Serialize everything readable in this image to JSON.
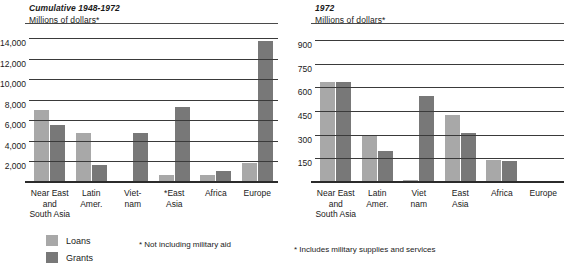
{
  "legend": {
    "loans_label": "Loans",
    "grants_label": "Grants",
    "loans_color": "#a8a8a8",
    "grants_color": "#787878"
  },
  "left": {
    "title": "Cumulative 1948-1972",
    "subtitle": "Millions of dollars*",
    "footnote": "* Not including military aid"
  },
  "right": {
    "title": "1972",
    "subtitle": "Millions of dollars*",
    "footnote": "* Includes military supplies and services"
  },
  "chart_data": [
    {
      "type": "bar",
      "title": "Cumulative 1948-1972",
      "subtitle": "Millions of dollars*",
      "xlabel": "",
      "ylabel": "Millions of dollars",
      "ylim": [
        0,
        15000
      ],
      "yticks": [
        "2,000",
        "4,000",
        "6,000",
        "8,000",
        "10,000",
        "12,000",
        "14,000"
      ],
      "ytick_values": [
        2000,
        4000,
        6000,
        8000,
        10000,
        12000,
        14000
      ],
      "grid": true,
      "legend_position": "below-left",
      "categories": [
        "Near East and South Asia",
        "Latin Amer.",
        "Viet-nam",
        "*East Asia",
        "Africa",
        "Europe"
      ],
      "category_lines": [
        [
          "Near East",
          "and",
          "South Asia"
        ],
        [
          "Latin",
          "Amer."
        ],
        [
          "Viet-",
          "nam"
        ],
        [
          "*East",
          "Asia"
        ],
        [
          "Africa"
        ],
        [
          "Europe"
        ]
      ],
      "series": [
        {
          "name": "Loans",
          "values": [
            7000,
            4750,
            100,
            700,
            700,
            1900
          ]
        },
        {
          "name": "Grants",
          "values": [
            5600,
            1700,
            4800,
            7300,
            1100,
            13700
          ]
        }
      ],
      "annotations": [
        "* Not including military aid"
      ]
    },
    {
      "type": "bar",
      "title": "1972",
      "subtitle": "Millions of dollars*",
      "xlabel": "",
      "ylabel": "Millions of dollars",
      "ylim": [
        0,
        975
      ],
      "yticks": [
        "150",
        "300",
        "450",
        "600",
        "750",
        "900"
      ],
      "ytick_values": [
        150,
        300,
        450,
        600,
        750,
        900
      ],
      "grid": true,
      "legend_position": "below-left",
      "categories": [
        "Near East and South Asia",
        "Latin Amer.",
        "Viet nam",
        "East Asia",
        "Africa",
        "Europe"
      ],
      "category_lines": [
        [
          "Near East",
          "and",
          "South Asia"
        ],
        [
          "Latin",
          "Amer."
        ],
        [
          "Viet",
          "nam"
        ],
        [
          "East",
          "Asia"
        ],
        [
          "Africa"
        ],
        [
          "Europe"
        ]
      ],
      "series": [
        {
          "name": "Loans",
          "values": [
            635,
            300,
            10,
            425,
            140,
            0
          ]
        },
        {
          "name": "Grants",
          "values": [
            635,
            195,
            545,
            310,
            130,
            0
          ]
        }
      ],
      "annotations": [
        "* Includes military supplies and services"
      ]
    }
  ]
}
